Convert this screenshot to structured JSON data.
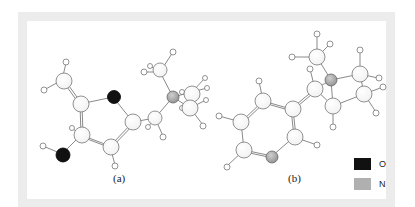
{
  "figure": {
    "panels": [
      {
        "id": "a",
        "label": "(a)"
      },
      {
        "id": "b",
        "label": "(b)"
      }
    ],
    "legend": [
      {
        "label": "O",
        "color": "#111111",
        "element": "oxygen"
      },
      {
        "label": "N",
        "color": "#b0b0b0",
        "element": "nitrogen"
      }
    ],
    "colors": {
      "frame": "#ececec",
      "carbon_fill": "#ffffff",
      "hydrogen_fill": "#ffffff",
      "atom_stroke": "#777777",
      "oxygen": "#111111",
      "nitrogen": "#a8a8a8",
      "bond": "#888888"
    }
  }
}
